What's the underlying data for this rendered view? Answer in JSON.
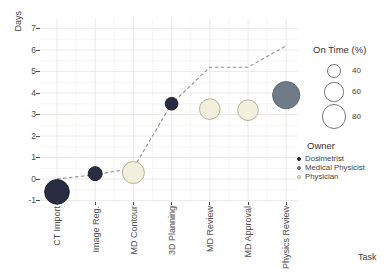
{
  "chart_data": {
    "type": "scatter",
    "title": "",
    "xlabel": "Task",
    "ylabel": "Days",
    "categories": [
      "CT Import",
      "Image Reg.",
      "MD Contour",
      "3D Planning",
      "MD Review",
      "MD Approval",
      "Physics Review"
    ],
    "ylim": [
      -1,
      7
    ],
    "yticks": [
      -1,
      0,
      1,
      2,
      3,
      4,
      5,
      6,
      7
    ],
    "grid": "major and minor gridlines, white background",
    "bubbles": [
      {
        "task": "CT Import",
        "days": -0.6,
        "on_time_pct": 80,
        "owner": "Dosimetrist"
      },
      {
        "task": "Image Reg.",
        "days": 0.25,
        "on_time_pct": 40,
        "owner": "Dosimetrist"
      },
      {
        "task": "MD Contour",
        "days": 0.3,
        "on_time_pct": 70,
        "owner": "Physician"
      },
      {
        "task": "3D Planning",
        "days": 3.5,
        "on_time_pct": 35,
        "owner": "Dosimetrist"
      },
      {
        "task": "MD Review",
        "days": 3.25,
        "on_time_pct": 65,
        "owner": "Physician"
      },
      {
        "task": "MD Approval",
        "days": 3.2,
        "on_time_pct": 65,
        "owner": "Physician"
      },
      {
        "task": "Physics Review",
        "days": 3.9,
        "on_time_pct": 90,
        "owner": "Medical Physicist"
      }
    ],
    "trend_line": {
      "style": "dashed",
      "color": "#909090",
      "values_by_category": [
        0,
        0.2,
        0.5,
        3.5,
        5.2,
        5.2,
        6.2
      ]
    },
    "size_legend": {
      "title": "On Time (%)",
      "values": [
        40,
        60,
        80
      ]
    },
    "owner_legend": {
      "title": "Owner",
      "entries": [
        {
          "label": "Dosimetrist",
          "color": "#2a2d42",
          "stroke": "#1d2030"
        },
        {
          "label": "Medical Physicist",
          "color": "#6f7c88",
          "stroke": "#5f6b77"
        },
        {
          "label": "Physician",
          "color": "#f2f0dc",
          "stroke": "#b3b195"
        }
      ]
    },
    "colors": {
      "grid_major": "#e8e4e2",
      "grid_minor": "#f3f0ef",
      "axis_text": "#4d4d4d"
    }
  }
}
